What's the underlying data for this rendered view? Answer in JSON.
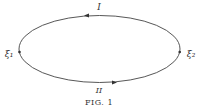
{
  "figure": {
    "caption": "FIG. 1",
    "path_labels": {
      "upper": "I",
      "lower": "II"
    },
    "point_labels": {
      "left": "ξ₁",
      "right": "ξ₂"
    },
    "stroke_color": "#444444",
    "background": "#ffffff"
  }
}
